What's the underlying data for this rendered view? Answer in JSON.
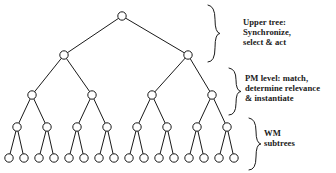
{
  "figure": {
    "background_color": "#ffffff",
    "stroke_color": "#1a1a1a",
    "node_fill": "#ffffff"
  },
  "annotations": [
    {
      "name": "upper-tree",
      "lines": [
        "Upper tree:",
        "Synchronize,",
        "select & act"
      ],
      "brace": {
        "x": 215,
        "y_top": 5,
        "y_bottom": 62
      }
    },
    {
      "name": "pm-level",
      "lines": [
        "PM level: match,",
        "determine relevance",
        "& instantiate"
      ],
      "brace": {
        "x": 236,
        "y_top": 68,
        "y_bottom": 115
      }
    },
    {
      "name": "wm-subtrees",
      "lines": [
        "WM",
        "subtrees"
      ],
      "brace": {
        "x": 256,
        "y_top": 118,
        "y_bottom": 170
      }
    }
  ],
  "tree": {
    "type": "binary-tree",
    "levels": 5,
    "node_radius": 4.2,
    "node_counts": [
      1,
      2,
      4,
      8,
      16
    ],
    "level_y": [
      16,
      55,
      95,
      127,
      158
    ],
    "nodes": {
      "level0": [
        122
      ],
      "level1": [
        64,
        188
      ],
      "level2": [
        32,
        92,
        152,
        212
      ],
      "level3": [
        17,
        47,
        77,
        107,
        137,
        167,
        197,
        227
      ],
      "level4": [
        9,
        24,
        39,
        54,
        69,
        84,
        99,
        114,
        129,
        144,
        159,
        174,
        189,
        204,
        219,
        234
      ]
    }
  }
}
